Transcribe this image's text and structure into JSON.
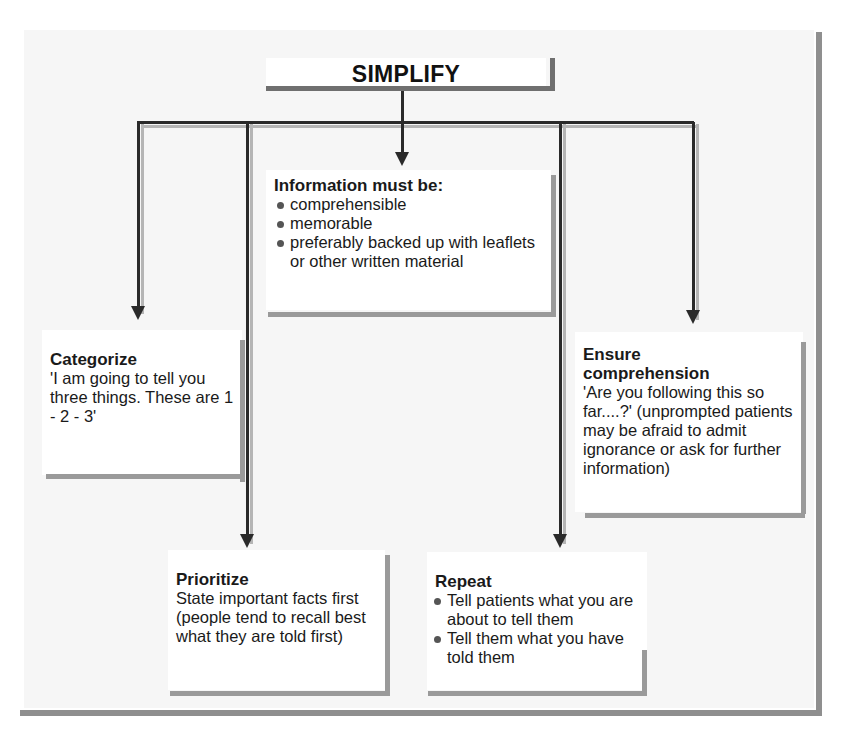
{
  "diagram": {
    "title": "SIMPLIFY",
    "center_box": {
      "heading": "Information must be:",
      "bullets": [
        "comprehensible",
        "memorable",
        "preferably backed up with leaflets or other written material"
      ]
    },
    "categorize": {
      "heading": "Categorize",
      "body": "'I am going to tell you three things. These are 1 - 2 -  3'"
    },
    "ensure_comprehension": {
      "heading": "Ensure comprehension",
      "body": "'Are you following this so far....?' (unprompted patients may be afraid to admit ignorance or ask for further information)"
    },
    "prioritize": {
      "heading": "Prioritize",
      "body": "State important facts first (people tend to recall best what they are told first)"
    },
    "repeat": {
      "heading": "Repeat",
      "bullets": [
        "Tell patients what you are about to tell them",
        "Tell them what you have told them"
      ]
    },
    "colors": {
      "background_panel": "#f6f6f6",
      "box_fill": "#ffffff",
      "connector": "#2a2a2a",
      "shadow": "#9a9a9a"
    }
  }
}
